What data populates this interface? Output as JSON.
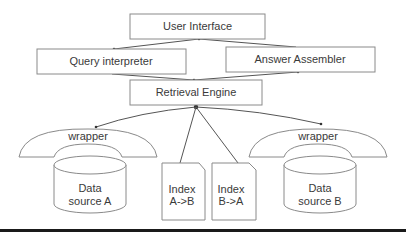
{
  "diagram": {
    "nodes": {
      "user_interface": {
        "label": "User Interface"
      },
      "query_interpreter": {
        "label": "Query interpreter"
      },
      "answer_assembler": {
        "label": "Answer Assembler"
      },
      "retrieval_engine": {
        "label": "Retrieval Engine"
      },
      "wrapper_a": {
        "label": "wrapper"
      },
      "wrapper_b": {
        "label": "wrapper"
      },
      "data_source_a": {
        "line1": "Data",
        "line2": "source A"
      },
      "data_source_b": {
        "line1": "Data",
        "line2": "source B"
      },
      "index_ab": {
        "line1": "Index",
        "line2": "A->B"
      },
      "index_ba": {
        "line1": "Index",
        "line2": "B->A"
      }
    },
    "edges": [
      {
        "from": "User Interface",
        "to": "Query interpreter"
      },
      {
        "from": "Answer Assembler",
        "to": "User Interface"
      },
      {
        "from": "Query interpreter",
        "to": "Retrieval Engine"
      },
      {
        "from": "Retrieval Engine",
        "to": "Answer Assembler"
      },
      {
        "from": "Retrieval Engine",
        "to": "wrapper (Data source A)"
      },
      {
        "from": "Retrieval Engine",
        "to": "wrapper (Data source B)"
      },
      {
        "from": "Retrieval Engine",
        "to": "Index A->B"
      },
      {
        "from": "Retrieval Engine",
        "to": "Index B->A"
      }
    ],
    "colors": {
      "stroke": "#8a8a8a",
      "edge": "#555555",
      "text": "#3a3a3a",
      "footer_bar": "#1a1a1a"
    }
  }
}
